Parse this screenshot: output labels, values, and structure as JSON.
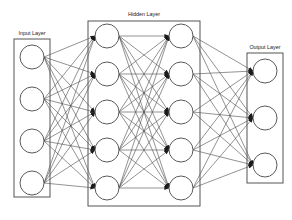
{
  "diagram": {
    "background_color": "#ffffff",
    "stroke_color": "#4a4a4a",
    "node_fill": "#ffffff",
    "node_stroke": "#5a5a5a",
    "box_stroke": "#555555",
    "label_color": "#1a1a1a",
    "width": 292,
    "height": 220
  },
  "labels": {
    "input": "Input Layer",
    "hidden": "Hidden Layer",
    "output": "Output Layer"
  },
  "layers": [
    {
      "id": "input",
      "label": "Input Layer",
      "node_count": 4,
      "cx": 32,
      "radius": 12,
      "node_y": [
        57,
        99,
        141,
        183
      ],
      "box": {
        "x": 14,
        "y": 39,
        "width": 36,
        "height": 158
      },
      "label_x": 32,
      "label_y": 35
    },
    {
      "id": "hidden1",
      "label": "Hidden Layer",
      "node_count": 5,
      "cx": 107,
      "radius": 12,
      "node_y": [
        36,
        74,
        112,
        150,
        188
      ],
      "box": {
        "x": 88,
        "y": 21,
        "width": 112,
        "height": 185
      },
      "label_x": 144,
      "label_y": 16
    },
    {
      "id": "hidden2",
      "label": "",
      "node_count": 5,
      "cx": 181,
      "radius": 12,
      "node_y": [
        36,
        74,
        112,
        150,
        188
      ],
      "box": null,
      "label_x": 0,
      "label_y": 0
    },
    {
      "id": "output",
      "label": "Output Layer",
      "node_count": 3,
      "cx": 265,
      "radius": 12,
      "node_y": [
        71,
        118,
        165
      ],
      "box": {
        "x": 247,
        "y": 53,
        "width": 36,
        "height": 130
      },
      "label_x": 265,
      "label_y": 49
    }
  ],
  "connections": [
    {
      "from": "input",
      "to": "hidden1",
      "type": "fully-connected",
      "edge_count": 20
    },
    {
      "from": "hidden1",
      "to": "hidden2",
      "type": "fully-connected",
      "edge_count": 25
    },
    {
      "from": "hidden2",
      "to": "output",
      "type": "fully-connected",
      "edge_count": 15
    }
  ],
  "summary": {
    "total_layers": 4,
    "total_nodes": 17,
    "total_edges": 60,
    "arrow_direction": "left-to-right"
  }
}
